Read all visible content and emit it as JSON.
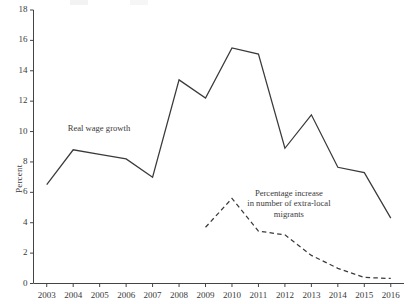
{
  "chart_data": {
    "type": "line",
    "title": "",
    "xlabel": "",
    "ylabel": "Percent",
    "ylim": [
      0,
      18
    ],
    "yticks": [
      0,
      2,
      4,
      6,
      8,
      10,
      12,
      14,
      16,
      18
    ],
    "grid": false,
    "legend_position": "inline-annotation",
    "categories": [
      "2003",
      "2004",
      "2005",
      "2006",
      "2007",
      "2008",
      "2009",
      "2010",
      "2011",
      "2012",
      "2013",
      "2014",
      "2015",
      "2016"
    ],
    "series": [
      {
        "name": "Real wage growth",
        "style": "solid",
        "color": "#3a3a3a",
        "values": [
          6.5,
          8.8,
          8.5,
          8.2,
          7.0,
          13.4,
          12.2,
          15.5,
          15.1,
          8.9,
          11.1,
          7.65,
          7.3,
          4.3
        ]
      },
      {
        "name": "Percentage increase in number of extra-local migrants",
        "style": "dashed",
        "color": "#3a3a3a",
        "values": [
          null,
          null,
          null,
          null,
          null,
          null,
          3.7,
          5.6,
          3.45,
          3.2,
          1.85,
          1.0,
          0.4,
          0.33
        ]
      }
    ],
    "annotations": [
      {
        "text": "Real wage growth",
        "x": "2005",
        "y": 10.2
      },
      {
        "text": "Percentage increase",
        "x": "2012",
        "y": 5.9
      },
      {
        "text": "in number of extra-local",
        "x": "2012.2",
        "y": 5.2
      },
      {
        "text": "migrants",
        "x": "2012.2",
        "y": 4.5
      }
    ]
  },
  "axis": {
    "y_label": "Percent",
    "y_tick_labels": [
      "18",
      "16",
      "14",
      "12",
      "10",
      "8",
      "6",
      "4",
      "2",
      "0"
    ],
    "x_tick_labels": [
      "2003",
      "2004",
      "2005",
      "2006",
      "2007",
      "2008",
      "2009",
      "2010",
      "2011",
      "2012",
      "2013",
      "2014",
      "2015",
      "2016"
    ]
  },
  "annotations": {
    "series1_label": "Real wage growth",
    "series2_label_line1": "Percentage  increase",
    "series2_label_line2": "in number of extra-local",
    "series2_label_line3": "migrants"
  }
}
